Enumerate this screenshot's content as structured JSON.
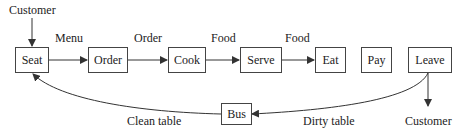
{
  "nodes": {
    "seat": "Seat",
    "order": "Order",
    "cook": "Cook",
    "serve": "Serve",
    "eat": "Eat",
    "pay": "Pay",
    "leave": "Leave",
    "bus": "Bus"
  },
  "edge_labels": {
    "customer_in": "Customer",
    "menu": "Menu",
    "order": "Order",
    "food1": "Food",
    "food2": "Food",
    "clean_table": "Clean table",
    "dirty_table": "Dirty table",
    "customer_out": "Customer"
  },
  "colors": {
    "line": "#333333",
    "box_border": "#444444"
  }
}
